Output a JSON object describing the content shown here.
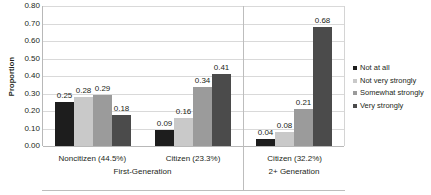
{
  "chart_data": {
    "type": "bar",
    "title": "",
    "xlabel": "",
    "ylabel": "Proportion",
    "ylim": [
      0,
      0.8
    ],
    "ytick_step": 0.1,
    "ytick_labels": [
      "0.80",
      "0.70",
      "0.60",
      "0.50",
      "0.40",
      "0.30",
      "0.20",
      "0.10",
      "0.00"
    ],
    "grid": true,
    "legend_position": "right",
    "categories": [
      "Noncitizen (44.5%)",
      "Citizen (23.3%)",
      "Citizen (32.2%)"
    ],
    "category_bands": [
      {
        "label": "First-Generation",
        "categories": [
          "Noncitizen (44.5%)",
          "Citizen (23.3%)"
        ]
      },
      {
        "label": "2+ Generation",
        "categories": [
          "Citizen (32.2%)"
        ]
      }
    ],
    "series": [
      {
        "name": "Not at all",
        "color": "#1d1d1d",
        "values": [
          0.25,
          0.09,
          0.04
        ],
        "labels": [
          "0.25",
          "0.09",
          "0.04"
        ]
      },
      {
        "name": "Not very strongly",
        "color": "#c9c9c9",
        "values": [
          0.28,
          0.16,
          0.08
        ],
        "labels": [
          "0.28",
          "0.16",
          "0.08"
        ]
      },
      {
        "name": "Somewhat strongly",
        "color": "#9b9b9b",
        "values": [
          0.29,
          0.34,
          0.21
        ],
        "labels": [
          "0.29",
          "0.34",
          "0.21"
        ]
      },
      {
        "name": "Very strongly",
        "color": "#4b4b4b",
        "values": [
          0.18,
          0.41,
          0.68
        ],
        "labels": [
          "0.18",
          "0.41",
          "0.68"
        ]
      }
    ]
  },
  "legend": {
    "items": [
      {
        "label": "Not at all",
        "color": "#1d1d1d"
      },
      {
        "label": "Not very strongly",
        "color": "#c9c9c9"
      },
      {
        "label": "Somewhat strongly",
        "color": "#9b9b9b"
      },
      {
        "label": "Very strongly",
        "color": "#4b4b4b"
      }
    ]
  }
}
